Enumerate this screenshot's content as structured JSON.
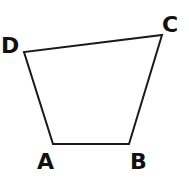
{
  "diagram": {
    "type": "quadrilateral",
    "stroke_color": "#1a1a1a",
    "fill_color": "#ffffff",
    "vertices": [
      {
        "name": "A",
        "x": 53,
        "y": 144,
        "label_x": 37,
        "label_y": 169
      },
      {
        "name": "B",
        "x": 129,
        "y": 144,
        "label_x": 130,
        "label_y": 169
      },
      {
        "name": "C",
        "x": 162,
        "y": 35,
        "label_x": 162,
        "label_y": 32
      },
      {
        "name": "D",
        "x": 24,
        "y": 52,
        "label_x": 1,
        "label_y": 53
      }
    ],
    "labels": {
      "A": "A",
      "B": "B",
      "C": "C",
      "D": "D"
    }
  }
}
